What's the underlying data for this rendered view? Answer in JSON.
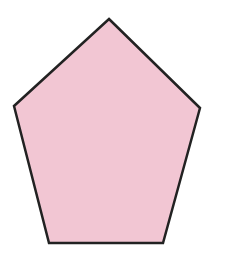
{
  "figure": {
    "shape": "pentagon",
    "fill_color": "#F2C6D3",
    "stroke_color": "#222222",
    "stroke_width": 2.5,
    "vertices": [
      [
        109,
        19
      ],
      [
        200,
        108
      ],
      [
        163,
        243
      ],
      [
        49,
        243
      ],
      [
        14,
        106
      ]
    ]
  }
}
